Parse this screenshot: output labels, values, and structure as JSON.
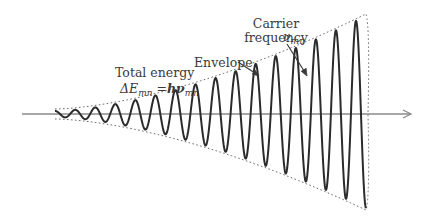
{
  "diagram": {
    "type": "amplitude-modulated wave",
    "colors": {
      "background": "#ffffff",
      "wave": "#2b2b2b",
      "axis": "#8a8a8a",
      "envelope": "#6a6a6a",
      "text": "#3a3a3a"
    },
    "axis": {
      "x_start": 22,
      "x_end": 412,
      "y": 114
    },
    "wave": {
      "x_start": 55,
      "x_end": 366,
      "y_center": 114,
      "cycles": 15.5,
      "amp_start": 3,
      "amp_end_up": 98,
      "amp_end_down": 94
    },
    "labels": {
      "total_energy": "Total energy",
      "delta": "ΔE",
      "delta_sub": "mn",
      "equals": " =",
      "h_nu": "hν",
      "h_nu_sub": "mn",
      "envelope": "Envelope",
      "carrier_line1": "Carrier",
      "carrier_line2": "frequency",
      "nu": "ν",
      "nu_sub": "mn"
    }
  }
}
